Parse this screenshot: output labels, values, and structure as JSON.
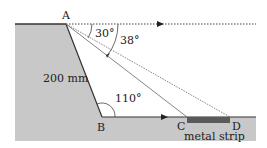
{
  "labels": {
    "A": "A",
    "B": "B",
    "C": "C",
    "D": "D",
    "length": "200 mm",
    "angle_30": "30°",
    "angle_38": "38°",
    "angle_110": "110°",
    "strip": "metal strip"
  },
  "colors": {
    "ground": "#c8c8c8",
    "strip": "#5a5a5a",
    "line": "#333333"
  }
}
